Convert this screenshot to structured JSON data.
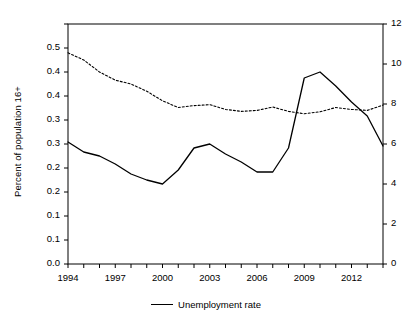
{
  "chart_data": {
    "type": "line",
    "title": "",
    "xlabel": "",
    "ylabel": "Percent of population 16+",
    "ylabel_right": "",
    "x": [
      1994,
      1995,
      1996,
      1997,
      1998,
      1999,
      2000,
      2001,
      2002,
      2003,
      2004,
      2005,
      2006,
      2007,
      2008,
      2009,
      2010,
      2011,
      2012,
      2013,
      2014
    ],
    "xlim": [
      1994,
      2014
    ],
    "xticks": [
      1994,
      1997,
      2000,
      2003,
      2006,
      2009,
      2012
    ],
    "xticklabels": [
      "1994",
      "1997",
      "2000",
      "2003",
      "2006",
      "2009",
      "2012"
    ],
    "ylim": [
      0.0,
      0.5
    ],
    "yticks": [
      0.0,
      0.05,
      0.1,
      0.15,
      0.2,
      0.25,
      0.3,
      0.35,
      0.4,
      0.45,
      0.5
    ],
    "yticklabels": [
      "0.0",
      "0.1",
      "0.1",
      "0.2",
      "0.2",
      "0.3",
      "0.3",
      "0.4",
      "0.4",
      "0.5"
    ],
    "ylim_right": [
      0,
      12
    ],
    "yticks_right": [
      0,
      2,
      4,
      6,
      8,
      10,
      12
    ],
    "yticklabels_right": [
      "0",
      "2",
      "4",
      "6",
      "8",
      "10",
      "12"
    ],
    "grid": false,
    "legend_position": "below-center",
    "series": [
      {
        "name": "Unemployment rate",
        "axis": "right",
        "style": "solid",
        "color": "#000000",
        "in_legend": true,
        "values": [
          6.1,
          5.6,
          5.4,
          5.0,
          4.5,
          4.2,
          4.0,
          4.7,
          5.8,
          6.0,
          5.5,
          5.1,
          4.6,
          4.6,
          5.8,
          9.3,
          9.6,
          8.9,
          8.1,
          7.4,
          5.9
        ]
      },
      {
        "name": "",
        "axis": "left",
        "style": "dashed",
        "color": "#000000",
        "in_legend": false,
        "values": [
          0.44,
          0.425,
          0.4,
          0.383,
          0.375,
          0.36,
          0.34,
          0.326,
          0.33,
          0.332,
          0.322,
          0.318,
          0.32,
          0.327,
          0.318,
          0.313,
          0.317,
          0.326,
          0.322,
          0.32,
          0.331
        ]
      }
    ]
  },
  "legend": {
    "entries": [
      {
        "label": "Unemployment rate"
      }
    ]
  },
  "axes": {
    "left_title": "Percent of population 16+"
  }
}
